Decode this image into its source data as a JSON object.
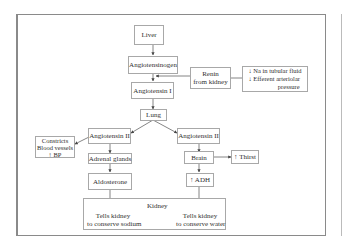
{
  "diagram": {
    "nodes": {
      "liver": "Liver",
      "angiotensinogen": "Angiotensinogen",
      "renin": [
        "Renin",
        "from kidney"
      ],
      "stimuli": [
        "↓ Na in tubular fluid",
        "↓ Efferent arteriolar",
        "pressure"
      ],
      "angiotensin_i": "Angiotensin I",
      "lung": "Lung",
      "angiotensin_ii_left": "Angiotensin II",
      "angiotensin_ii_right": "Angiotensin II",
      "constricts": [
        "Constricts",
        "Blood vessels",
        "↑ BP"
      ],
      "adrenal_glands": "Adrenal glands",
      "aldosterone": "Aldosterone",
      "brain": "Brain",
      "thirst": "↑ Thirst",
      "adh": "↑ ADH",
      "kidney": {
        "title": "Kidney",
        "left": [
          "Tells kidney",
          "to conserve sodium"
        ],
        "right": [
          "Tells kidney",
          "to conserve water"
        ]
      }
    },
    "edges": [
      [
        "Liver",
        "Angiotensinogen"
      ],
      [
        "Angiotensinogen",
        "Angiotensin I"
      ],
      [
        "Renin from kidney",
        "Angiotensinogen→Angiotensin I"
      ],
      [
        "Stimuli",
        "Renin from kidney"
      ],
      [
        "Angiotensin I",
        "Lung"
      ],
      [
        "Lung",
        "Angiotensin II (left)"
      ],
      [
        "Lung",
        "Angiotensin II (right)"
      ],
      [
        "Angiotensin II (left)",
        "Constricts Blood vessels ↑ BP"
      ],
      [
        "Angiotensin II (left)",
        "Adrenal glands"
      ],
      [
        "Adrenal glands",
        "Aldosterone"
      ],
      [
        "Aldosterone",
        "Kidney: conserve sodium"
      ],
      [
        "Angiotensin II (right)",
        "Brain"
      ],
      [
        "Brain",
        "↑ Thirst"
      ],
      [
        "Brain",
        "↑ ADH"
      ],
      [
        "↑ ADH",
        "Kidney: conserve water"
      ]
    ]
  }
}
